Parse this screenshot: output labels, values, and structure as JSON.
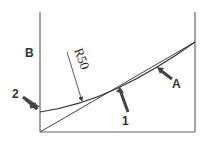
{
  "diagram": {
    "labels": {
      "b": "B",
      "two": "2",
      "one": "1",
      "a": "A",
      "radius": "R50"
    },
    "colors": {
      "line": "#555555",
      "arrow": "#444444",
      "background": "#ffffff"
    }
  }
}
